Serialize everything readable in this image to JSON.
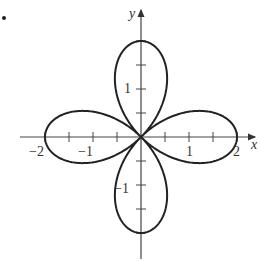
{
  "chart_data": {
    "type": "line",
    "title": "",
    "equation": "r = 2cos(2θ)",
    "xlabel": "x",
    "ylabel": "y",
    "xlim": [
      -2.5,
      2.4
    ],
    "ylim": [
      -2.5,
      2.7
    ],
    "grid": false,
    "x_ticks": [
      -2,
      -1.5,
      -1,
      -0.5,
      0.5,
      1,
      1.5,
      2
    ],
    "y_ticks": [
      -2,
      -1.5,
      -1,
      -0.5,
      0.5,
      1,
      1.5,
      2
    ],
    "x_tick_labels": [
      "-2",
      "-1",
      "1",
      "2"
    ],
    "y_tick_labels": [
      "1",
      "-1"
    ],
    "series": [
      {
        "name": "rose",
        "petals": 4,
        "petal_length": 2,
        "petal_directions_deg": [
          0,
          90,
          180,
          270
        ]
      }
    ],
    "color": "#222222"
  },
  "labels": {
    "x_axis": "x",
    "y_axis": "y",
    "tick_neg2": "−2",
    "tick_neg1": "−1",
    "tick_pos1": "1",
    "tick_pos2": "2",
    "tick_y_pos1": "1",
    "tick_y_neg1": "−1"
  }
}
